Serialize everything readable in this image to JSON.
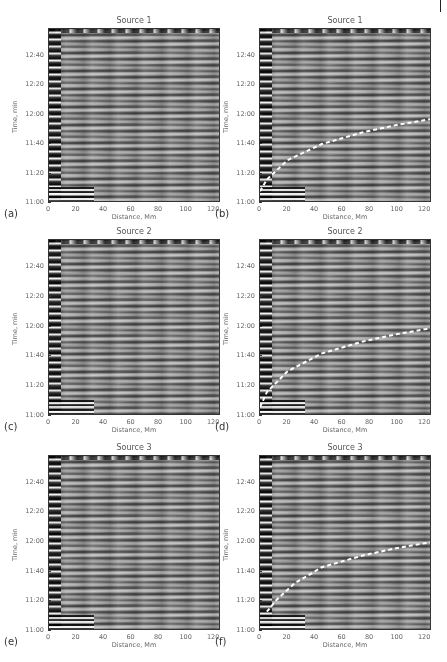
{
  "figure": {
    "page_marker": "|",
    "panels": [
      {
        "id": "a",
        "label": "(a)",
        "title": "Source 1",
        "has_curve": false,
        "left": 48,
        "top": 28,
        "width": 172,
        "height": 174
      },
      {
        "id": "b",
        "label": "(b)",
        "title": "Source 1",
        "has_curve": true,
        "left": 259,
        "top": 28,
        "width": 172,
        "height": 174
      },
      {
        "id": "c",
        "label": "(c)",
        "title": "Source 2",
        "has_curve": false,
        "left": 48,
        "top": 239,
        "width": 172,
        "height": 176
      },
      {
        "id": "d",
        "label": "(d)",
        "title": "Source 2",
        "has_curve": true,
        "left": 259,
        "top": 239,
        "width": 172,
        "height": 176
      },
      {
        "id": "e",
        "label": "(e)",
        "title": "Source 3",
        "has_curve": false,
        "left": 48,
        "top": 455,
        "width": 172,
        "height": 175
      },
      {
        "id": "f",
        "label": "(f)",
        "title": "Source 3",
        "has_curve": true,
        "left": 259,
        "top": 455,
        "width": 172,
        "height": 175
      }
    ],
    "axes": {
      "xlabel": "Distance, Mm",
      "ylabel": "Time, min",
      "xticks": [
        "0",
        "20",
        "40",
        "60",
        "80",
        "100",
        "120"
      ],
      "yticks": [
        "11:00",
        "11:20",
        "11:40",
        "12:00",
        "12:20",
        "12:40"
      ]
    }
  },
  "chart_data": [
    {
      "type": "heatmap",
      "panel": "a",
      "title": "Source 1",
      "xlabel": "Distance, Mm",
      "ylabel": "Time, min",
      "xlim": [
        0,
        125
      ],
      "ylim_minutes": [
        660,
        778
      ],
      "xticks": [
        0,
        20,
        40,
        60,
        80,
        100,
        120
      ],
      "yticks": [
        "11:00",
        "11:20",
        "11:40",
        "12:00",
        "12:20",
        "12:40"
      ],
      "colormap": "grayscale",
      "description": "time-distance plot of horizontal oscillation stripes"
    },
    {
      "type": "heatmap",
      "panel": "b",
      "title": "Source 1",
      "xlabel": "Distance, Mm",
      "ylabel": "Time, min",
      "xlim": [
        0,
        125
      ],
      "ylim_minutes": [
        660,
        778
      ],
      "xticks": [
        0,
        20,
        40,
        60,
        80,
        100,
        120
      ],
      "yticks": [
        "11:00",
        "11:20",
        "11:40",
        "12:00",
        "12:20",
        "12:40"
      ],
      "overlay": {
        "style": "white dashed line",
        "x_Mm": [
          0,
          5,
          20,
          45,
          75,
          100,
          125
        ],
        "t_min": [
          668,
          676,
          689,
          700,
          708,
          713,
          717
        ]
      }
    },
    {
      "type": "heatmap",
      "panel": "c",
      "title": "Source 2",
      "xlabel": "Distance, Mm",
      "ylabel": "Time, min",
      "xlim": [
        0,
        125
      ],
      "ylim_minutes": [
        660,
        778
      ],
      "xticks": [
        0,
        20,
        40,
        60,
        80,
        100,
        120
      ],
      "yticks": [
        "11:00",
        "11:20",
        "11:40",
        "12:00",
        "12:20",
        "12:40"
      ]
    },
    {
      "type": "heatmap",
      "panel": "d",
      "title": "Source 2",
      "xlabel": "Distance, Mm",
      "ylabel": "Time, min",
      "xlim": [
        0,
        125
      ],
      "ylim_minutes": [
        660,
        778
      ],
      "xticks": [
        0,
        20,
        40,
        60,
        80,
        100,
        120
      ],
      "yticks": [
        "11:00",
        "11:20",
        "11:40",
        "12:00",
        "12:20",
        "12:40"
      ],
      "overlay": {
        "style": "white dashed line",
        "x_Mm": [
          0,
          5,
          20,
          45,
          75,
          100,
          125
        ],
        "t_min": [
          666,
          676,
          690,
          702,
          710,
          715,
          719
        ]
      }
    },
    {
      "type": "heatmap",
      "panel": "e",
      "title": "Source 3",
      "xlabel": "Distance, Mm",
      "ylabel": "Time, min",
      "xlim": [
        0,
        125
      ],
      "ylim_minutes": [
        660,
        778
      ],
      "xticks": [
        0,
        20,
        40,
        60,
        80,
        100,
        120
      ],
      "yticks": [
        "11:00",
        "11:20",
        "11:40",
        "12:00",
        "12:20",
        "12:40"
      ]
    },
    {
      "type": "heatmap",
      "panel": "f",
      "title": "Source 3",
      "xlabel": "Distance, Mm",
      "ylabel": "Time, min",
      "xlim": [
        0,
        125
      ],
      "ylim_minutes": [
        660,
        778
      ],
      "xticks": [
        0,
        20,
        40,
        60,
        80,
        100,
        120
      ],
      "yticks": [
        "11:00",
        "11:20",
        "11:40",
        "12:00",
        "12:20",
        "12:40"
      ],
      "overlay": {
        "style": "white dashed line",
        "x_Mm": [
          5,
          12,
          25,
          45,
          75,
          100,
          125
        ],
        "t_min": [
          673,
          681,
          692,
          703,
          711,
          716,
          720
        ]
      }
    }
  ]
}
